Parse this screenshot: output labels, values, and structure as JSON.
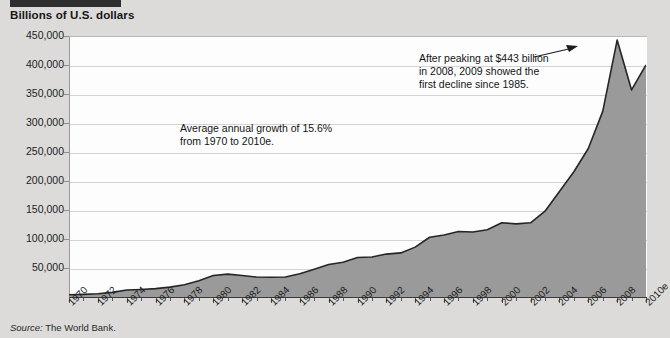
{
  "title": "Billions of U.S. dollars",
  "source_prefix": "Source:",
  "source_text": " The World Bank.",
  "annotations": {
    "left": "Average annual growth of 15.6%\nfrom 1970 to 2010e.",
    "right": "After peaking at $443 billion\nin 2008, 2009 showed the\nfirst decline since 1985."
  },
  "colors": {
    "area_fill": "#9a9a9a",
    "area_line": "#262626",
    "plot_bg": "#fdfdfd",
    "page_bg": "#dcdbd9",
    "header_bar": "#2f2f2f",
    "gridline": "#d3d3d3"
  },
  "chart_data": {
    "type": "area",
    "title": "Billions of U.S. dollars",
    "xlabel": "",
    "ylabel": "Billions of U.S. dollars",
    "ylim": [
      0,
      450000
    ],
    "yticks": [
      50000,
      100000,
      150000,
      200000,
      250000,
      300000,
      350000,
      400000,
      450000
    ],
    "ytick_labels": [
      "50,000",
      "100,000",
      "150,000",
      "200,000",
      "250,000",
      "300,000",
      "350,000",
      "400,000",
      "450,000"
    ],
    "xtick_labels": [
      "1970",
      "1972",
      "1974",
      "1976",
      "1978",
      "1980",
      "1982",
      "1984",
      "1986",
      "1988",
      "1990",
      "1992",
      "1994",
      "1996",
      "1998",
      "2000",
      "2002",
      "2004",
      "2006",
      "2008",
      "2010e"
    ],
    "grid": true,
    "legend": "none",
    "x": [
      1970,
      1971,
      1972,
      1973,
      1974,
      1975,
      1976,
      1977,
      1978,
      1979,
      1980,
      1981,
      1982,
      1983,
      1984,
      1985,
      1986,
      1987,
      1988,
      1989,
      1990,
      1991,
      1992,
      1993,
      1994,
      1995,
      1996,
      1997,
      1998,
      1999,
      2000,
      2001,
      2002,
      2003,
      2004,
      2005,
      2006,
      2007,
      2008,
      2009,
      2010
    ],
    "values": [
      4000,
      4500,
      5500,
      8000,
      12000,
      13000,
      14500,
      17000,
      21000,
      28000,
      37000,
      39500,
      37000,
      34500,
      34000,
      34500,
      40000,
      48000,
      56000,
      60000,
      68000,
      69000,
      74000,
      76000,
      86000,
      103000,
      107000,
      113000,
      112000,
      116000,
      128000,
      126000,
      128000,
      148000,
      182000,
      216000,
      256000,
      320000,
      443000,
      357000,
      400000
    ],
    "annotations": [
      {
        "text": "Average annual growth of 15.6% from 1970 to 2010e.",
        "position": "inside-left"
      },
      {
        "text": "After peaking at $443 billion in 2008, 2009 showed the first decline since 1985.",
        "position": "inside-right",
        "points_to": {
          "x": 2008,
          "y": 443000
        }
      }
    ]
  }
}
